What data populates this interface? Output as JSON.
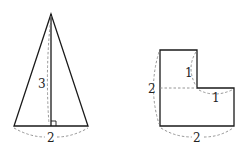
{
  "figures": [
    {
      "name": "triangle",
      "labels": {
        "height": "3",
        "base": "2"
      }
    },
    {
      "name": "l-shape",
      "labels": {
        "notch_height": "1",
        "notch_width": "1",
        "left_side": "2",
        "bottom_side": "2"
      }
    }
  ],
  "colors": {
    "line": "#1a1a1a",
    "dashed": "#8a8a8a",
    "background": "#ffffff"
  }
}
